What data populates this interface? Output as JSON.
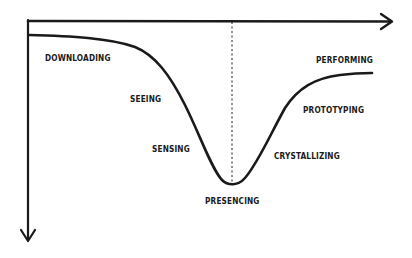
{
  "diagram": {
    "type": "u-curve",
    "axes": {
      "horizontal_arrow": "right",
      "vertical_arrow": "down"
    },
    "stages": [
      {
        "id": "downloading",
        "label": "DOWNLOADING"
      },
      {
        "id": "seeing",
        "label": "SEEING"
      },
      {
        "id": "sensing",
        "label": "SENSING"
      },
      {
        "id": "presencing",
        "label": "PRESENCING"
      },
      {
        "id": "crystallizing",
        "label": "CRYSTALLIZING"
      },
      {
        "id": "prototyping",
        "label": "PROTOTYPING"
      },
      {
        "id": "performing",
        "label": "PERFORMING"
      }
    ],
    "colors": {
      "ink": "#1a1a1a",
      "background": "#ffffff"
    }
  }
}
